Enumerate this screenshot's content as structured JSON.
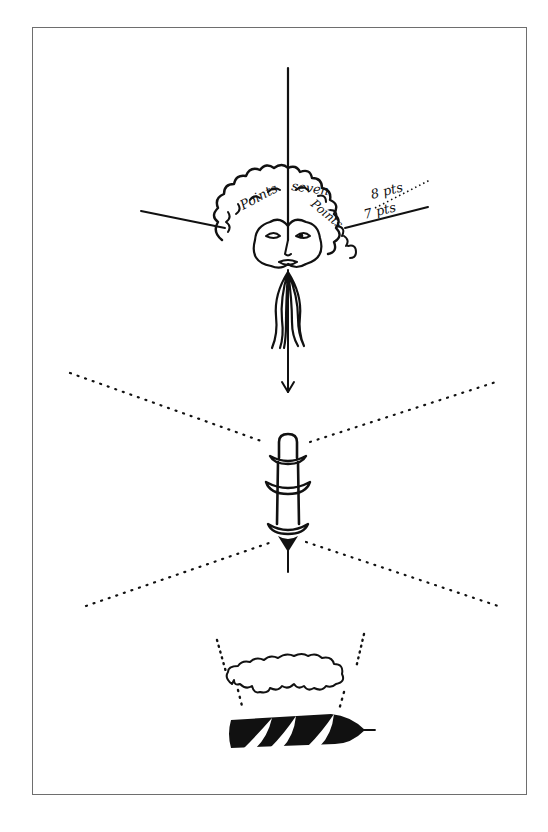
{
  "figure": {
    "frame_color": "#6e6e6e",
    "ink_color": "#111111",
    "background": "#ffffff"
  },
  "top_figure": {
    "description": "face with curly hair made of text, axes and point-size markers",
    "hair_text": [
      "Points",
      "seven",
      "Points"
    ],
    "markers": [
      {
        "label": "8 pts"
      },
      {
        "label": "7 pts"
      }
    ]
  },
  "middle_figure": {
    "description": "ribbed spindle with dotted perspective lines"
  },
  "bottom_figure": {
    "description": "cloud above spiral black drill form with dotted lines"
  }
}
